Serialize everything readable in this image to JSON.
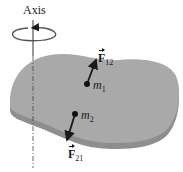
{
  "diagram": {
    "axis_label": "Axis",
    "body_color": "#a9a9a9",
    "body_edge_color": "#8e8e8e",
    "masses": [
      {
        "id": "m1",
        "symbol": "m",
        "subscript": "1",
        "x": 87,
        "y": 84
      },
      {
        "id": "m2",
        "symbol": "m",
        "subscript": "2",
        "x": 75,
        "y": 114
      }
    ],
    "forces": [
      {
        "id": "F12",
        "symbol": "F",
        "subscript": "12",
        "from": "m1",
        "direction": "up-right"
      },
      {
        "id": "F21",
        "symbol": "F",
        "subscript": "21",
        "from": "m2",
        "direction": "down-left"
      }
    ],
    "rotation_indicator": "counter-clockwise-about-axis"
  }
}
